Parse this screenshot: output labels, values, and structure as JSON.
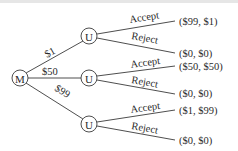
{
  "diagram": {
    "type": "game-tree",
    "root": {
      "label": "M"
    },
    "offers": [
      {
        "label": "$1",
        "responder": "U",
        "responses": [
          {
            "label": "Accept",
            "payoff": "($99, $1)"
          },
          {
            "label": "Reject",
            "payoff": "($0, $0)"
          }
        ]
      },
      {
        "label": "$50",
        "responder": "U",
        "responses": [
          {
            "label": "Accept",
            "payoff": "($50, $50)"
          },
          {
            "label": "Reject",
            "payoff": "($0, $0)"
          }
        ]
      },
      {
        "label": "$99",
        "responder": "U",
        "responses": [
          {
            "label": "Accept",
            "payoff": "($1, $99)"
          },
          {
            "label": "Reject",
            "payoff": "($0, $0)"
          }
        ]
      }
    ]
  }
}
